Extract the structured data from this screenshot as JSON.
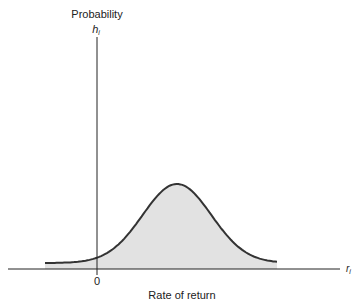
{
  "chart_data": {
    "type": "area",
    "title": "",
    "ylabel": "Probability",
    "ylabel_symbol": "h",
    "ylabel_subscript": "i",
    "xlabel": "Rate of return",
    "xlabel_symbol": "r",
    "xlabel_subscript": "i",
    "x_ticks": [
      {
        "value": 0,
        "label": "0"
      }
    ],
    "distribution": "normal",
    "mean": 1.0,
    "sd": 0.43,
    "xlim": [
      -0.7,
      2.4
    ],
    "x_range_drawn": [
      -0.65,
      2.25
    ],
    "ylim": [
      0,
      1.1
    ],
    "peak_height": 1.0,
    "grid": false,
    "legend": "none",
    "fill_color": "#e2e2e2",
    "line_color": "#333333"
  }
}
